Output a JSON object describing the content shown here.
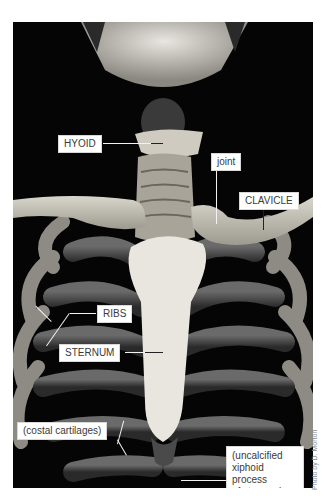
{
  "figure": {
    "labels": {
      "hyoid": "HYOID",
      "joint": "joint",
      "clavicle": "CLAVICLE",
      "ribs": "RIBS",
      "sternum": "STERNUM",
      "costal_cartilages": "(costal cartilages)",
      "xiphoid_line1": "(uncalcified",
      "xiphoid_line2": "xiphoid process",
      "xiphoid_line3": "of sternum)"
    },
    "credit": "Photo by D. Morton"
  }
}
